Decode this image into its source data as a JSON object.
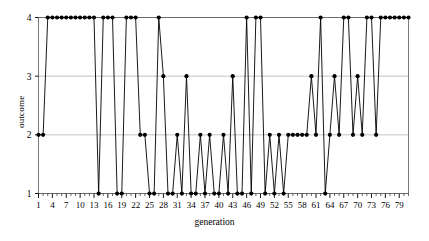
{
  "chart_data": {
    "type": "line",
    "title": "",
    "xlabel": "generation",
    "ylabel": "outcome",
    "xlim": [
      1,
      81
    ],
    "ylim": [
      1,
      4
    ],
    "grid": true,
    "legend": null,
    "marker": "filled-circle",
    "line_color": "#000000",
    "grid_color": "#aaaaaa",
    "yticks": [
      1,
      2,
      3,
      4
    ],
    "ytick_labels": [
      "1",
      "2",
      "3",
      "4"
    ],
    "xticks": [
      1,
      4,
      7,
      10,
      13,
      16,
      19,
      22,
      25,
      28,
      31,
      34,
      37,
      40,
      43,
      46,
      49,
      52,
      55,
      58,
      61,
      64,
      67,
      70,
      73,
      76,
      79
    ],
    "xtick_labels": [
      "1",
      "4",
      "7",
      "10",
      "13",
      "16",
      "19",
      "22",
      "25",
      "28",
      "31",
      "34",
      "37",
      "40",
      "43",
      "46",
      "49",
      "52",
      "55",
      "58",
      "61",
      "64",
      "67",
      "70",
      "73",
      "76",
      "79"
    ],
    "x": [
      1,
      2,
      3,
      4,
      5,
      6,
      7,
      8,
      9,
      10,
      11,
      12,
      13,
      14,
      15,
      16,
      17,
      18,
      19,
      20,
      21,
      22,
      23,
      24,
      25,
      26,
      27,
      28,
      29,
      30,
      31,
      32,
      33,
      34,
      35,
      36,
      37,
      38,
      39,
      40,
      41,
      42,
      43,
      44,
      45,
      46,
      47,
      48,
      49,
      50,
      51,
      52,
      53,
      54,
      55,
      56,
      57,
      58,
      59,
      60,
      61,
      62,
      63,
      64,
      65,
      66,
      67,
      68,
      69,
      70,
      71,
      72,
      73,
      74,
      75,
      76,
      77,
      78,
      79,
      80,
      81
    ],
    "values": [
      2,
      2,
      4,
      4,
      4,
      4,
      4,
      4,
      4,
      4,
      4,
      4,
      4,
      1,
      4,
      4,
      4,
      1,
      1,
      4,
      4,
      4,
      2,
      2,
      1,
      1,
      4,
      3,
      1,
      1,
      2,
      1,
      3,
      1,
      1,
      2,
      1,
      2,
      1,
      1,
      2,
      1,
      3,
      1,
      1,
      4,
      1,
      4,
      4,
      1,
      2,
      1,
      2,
      1,
      2,
      2,
      2,
      2,
      2,
      3,
      2,
      4,
      1,
      2,
      3,
      2,
      4,
      4,
      2,
      3,
      2,
      4,
      4,
      2,
      4,
      4,
      4,
      4,
      4,
      4,
      4
    ],
    "series_name": "outcome"
  }
}
